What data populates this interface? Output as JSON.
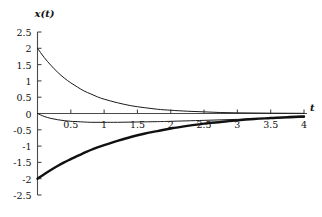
{
  "chart_data": {
    "type": "line",
    "title": "",
    "xlabel": "t",
    "ylabel": "x(t)",
    "xlim": [
      0,
      4
    ],
    "ylim": [
      -2.5,
      2.5
    ],
    "grid": false,
    "legend": null,
    "xticks": [
      0.5,
      1,
      1.5,
      2,
      2.5,
      3,
      3.5,
      4
    ],
    "xtick_labels": [
      "0.5",
      "1",
      "1.5",
      "2",
      "2.5",
      "3",
      "3.5",
      "4"
    ],
    "yticks": [
      2.5,
      2,
      1.5,
      1,
      0.5,
      0,
      -0.5,
      -1,
      -1.5,
      -2,
      -2.5
    ],
    "ytick_labels": [
      "2.5",
      "2",
      "1.5",
      "1",
      "0.5",
      "0",
      "-0.5",
      "-1",
      "-1.5",
      "-2",
      "-2.5"
    ],
    "series": [
      {
        "name": "decaying-positive",
        "line_width": "thin",
        "color": "#1a1a1a",
        "x": [
          0,
          0.1,
          0.2,
          0.3,
          0.4,
          0.5,
          0.6,
          0.7,
          0.8,
          0.9,
          1.0,
          1.2,
          1.4,
          1.6,
          1.8,
          2.0,
          2.25,
          2.5,
          2.75,
          3.0,
          3.25,
          3.5,
          3.75,
          4.0
        ],
        "values": [
          2.0,
          1.72,
          1.48,
          1.27,
          1.09,
          0.94,
          0.81,
          0.69,
          0.6,
          0.51,
          0.44,
          0.33,
          0.24,
          0.18,
          0.13,
          0.1,
          0.07,
          0.05,
          0.03,
          0.02,
          0.015,
          0.01,
          0.008,
          0.005
        ]
      },
      {
        "name": "shallow-negative",
        "line_width": "thin",
        "color": "#1a1a1a",
        "x": [
          0,
          0.1,
          0.2,
          0.3,
          0.4,
          0.5,
          0.6,
          0.8,
          1.0,
          1.2,
          1.5,
          1.8,
          2.0,
          2.5,
          3.0,
          3.5,
          4.0
        ],
        "values": [
          0.0,
          -0.09,
          -0.15,
          -0.19,
          -0.22,
          -0.24,
          -0.25,
          -0.27,
          -0.27,
          -0.27,
          -0.26,
          -0.25,
          -0.24,
          -0.21,
          -0.18,
          -0.15,
          -0.12
        ]
      },
      {
        "name": "rising-from-minus-two",
        "line_width": "thick",
        "color": "#111111",
        "x": [
          0,
          0.1,
          0.2,
          0.3,
          0.4,
          0.5,
          0.6,
          0.7,
          0.8,
          0.9,
          1.0,
          1.2,
          1.4,
          1.6,
          1.8,
          2.0,
          2.25,
          2.5,
          2.75,
          3.0,
          3.25,
          3.5,
          3.75,
          4.0
        ],
        "values": [
          -2.0,
          -1.86,
          -1.73,
          -1.61,
          -1.5,
          -1.4,
          -1.3,
          -1.21,
          -1.12,
          -1.04,
          -0.97,
          -0.84,
          -0.72,
          -0.62,
          -0.54,
          -0.46,
          -0.38,
          -0.31,
          -0.26,
          -0.21,
          -0.17,
          -0.14,
          -0.11,
          -0.09
        ]
      }
    ]
  }
}
